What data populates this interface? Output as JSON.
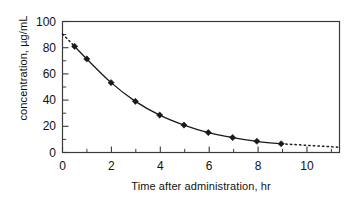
{
  "chart_data": {
    "type": "line",
    "title": "",
    "xlabel": "Time after administration, hr",
    "ylabel": "concentration, µg/mL",
    "xlim": [
      0,
      11.4
    ],
    "ylim": [
      0,
      105
    ],
    "xticks": [
      0,
      2,
      4,
      6,
      8,
      10
    ],
    "xtick_labels": [
      "0",
      "2",
      "4",
      "6",
      "8",
      "10"
    ],
    "xminor_ticks": [
      1,
      3,
      5,
      7,
      9,
      11
    ],
    "yticks": [
      0,
      20,
      40,
      60,
      80,
      100
    ],
    "ytick_labels": [
      "0",
      "20",
      "40",
      "60",
      "80",
      "100"
    ],
    "yminor_ticks": [
      10,
      30,
      50,
      70,
      90
    ],
    "grid": false,
    "legend": false,
    "legend_position": "none",
    "marker": "diamond",
    "marker_color": "#1a1a1a",
    "line_color": "#1a1a1a",
    "series": [
      {
        "name": "plasma concentration",
        "style": "solid-with-markers",
        "x": [
          0.5,
          1,
          2,
          3,
          4,
          5,
          6,
          7,
          8,
          9
        ],
        "values": [
          85,
          75,
          56,
          41,
          30,
          22,
          16,
          12,
          9,
          7
        ]
      },
      {
        "name": "extrapolation to time zero",
        "style": "dotted",
        "x": [
          0,
          0.5
        ],
        "values": [
          95,
          85
        ]
      },
      {
        "name": "extrapolation beyond last sample",
        "style": "dotted",
        "x": [
          9,
          11.4
        ],
        "values": [
          7,
          4.2
        ]
      }
    ],
    "annotations": []
  },
  "axes": {
    "frame_color": "#3a3a3a",
    "background": "#ffffff"
  }
}
